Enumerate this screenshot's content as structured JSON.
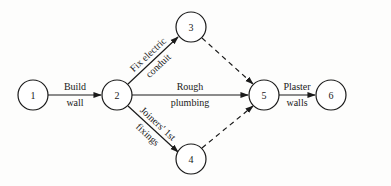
{
  "diagram": {
    "type": "activity-on-arrow network",
    "nodes": [
      {
        "id": "1",
        "label": "1",
        "x": 33,
        "y": 95
      },
      {
        "id": "2",
        "label": "2",
        "x": 117,
        "y": 95
      },
      {
        "id": "3",
        "label": "3",
        "x": 191,
        "y": 27
      },
      {
        "id": "4",
        "label": "4",
        "x": 191,
        "y": 159
      },
      {
        "id": "5",
        "label": "5",
        "x": 264,
        "y": 95
      },
      {
        "id": "6",
        "label": "6",
        "x": 331,
        "y": 95
      }
    ],
    "edges": [
      {
        "from": "1",
        "to": "2",
        "style": "solid",
        "label_top": "Build",
        "label_bottom": "wall"
      },
      {
        "from": "2",
        "to": "3",
        "style": "solid",
        "label_top": "Fix electric",
        "label_bottom": "conduit"
      },
      {
        "from": "2",
        "to": "5",
        "style": "solid",
        "label_top": "Rough",
        "label_bottom": "plumbing"
      },
      {
        "from": "2",
        "to": "4",
        "style": "solid",
        "label_top": "Joiners' 1st",
        "label_bottom": "fixings"
      },
      {
        "from": "3",
        "to": "5",
        "style": "dashed",
        "label_top": "",
        "label_bottom": ""
      },
      {
        "from": "4",
        "to": "5",
        "style": "dashed",
        "label_top": "",
        "label_bottom": ""
      },
      {
        "from": "5",
        "to": "6",
        "style": "solid",
        "label_top": "Plaster",
        "label_bottom": "walls"
      }
    ],
    "node_radius": 15,
    "colors": {
      "line": "#1a1a1a",
      "background": "#fdfdfc"
    }
  }
}
